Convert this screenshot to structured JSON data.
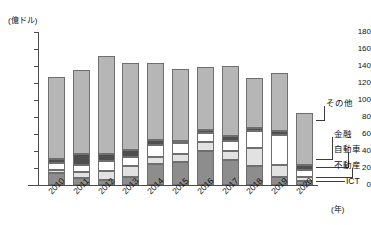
{
  "chart": {
    "title_truncated": "",
    "yaxis_unit": "(億ドル)",
    "xaxis_unit": "(年)"
  },
  "chart_data": {
    "type": "bar",
    "stacked": true,
    "title": "",
    "xlabel": "(年)",
    "ylabel": "(億ドル)",
    "ylim": [
      0,
      180
    ],
    "yticks": [
      0,
      20,
      40,
      60,
      80,
      100,
      120,
      140,
      160,
      180
    ],
    "grid": false,
    "legend_position": "right-callouts",
    "categories": [
      "2010",
      "2011",
      "2012",
      "2013",
      "2014",
      "2015",
      "2016",
      "2017",
      "2018",
      "2019",
      "2020"
    ],
    "series": [
      {
        "name": "ICT",
        "color": "#8d8d8d",
        "values": [
          14,
          8,
          6,
          9,
          25,
          27,
          40,
          29,
          22,
          9,
          5
        ]
      },
      {
        "name": "不動産",
        "color": "#e2e2e2",
        "values": [
          4,
          7,
          10,
          13,
          8,
          9,
          11,
          11,
          22,
          14,
          4
        ]
      },
      {
        "name": "自動車",
        "color": "#ffffff",
        "values": [
          8,
          8,
          12,
          11,
          14,
          13,
          10,
          12,
          20,
          36,
          9
        ]
      },
      {
        "name": "金融",
        "color": "#4f4f4f",
        "values": [
          5,
          14,
          8,
          8,
          6,
          3,
          4,
          6,
          3,
          4,
          6
        ]
      },
      {
        "name": "その他",
        "color": "#b6b6b6",
        "values": [
          96,
          98,
          116,
          102,
          90,
          85,
          74,
          82,
          59,
          69,
          61
        ]
      }
    ],
    "totals": [
      127,
      135,
      152,
      143,
      143,
      137,
      139,
      140,
      126,
      132,
      85
    ]
  },
  "callouts": [
    {
      "label": "その他"
    },
    {
      "label": "金融"
    },
    {
      "label": "自動車"
    },
    {
      "label": "不動産"
    },
    {
      "label": "ICT"
    }
  ]
}
